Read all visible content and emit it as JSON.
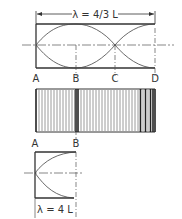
{
  "diagram": {
    "top": {
      "dimension_label": "λ = 4/3 L",
      "points": [
        "A",
        "B",
        "C",
        "D"
      ]
    },
    "bars": {
      "description": "density pattern of vertical lines (compressions/rarefactions)"
    },
    "bottom": {
      "dimension_label": "λ = 4 L",
      "points": [
        "A",
        "B"
      ]
    },
    "colors": {
      "line": "#333333",
      "bar_dark": "#222222",
      "bar_light": "#9a9a9a"
    }
  }
}
